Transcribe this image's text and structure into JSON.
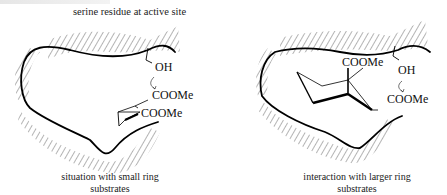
{
  "diagram": {
    "title_fragment": "",
    "left_panel": {
      "top_label": "serine residue at active site",
      "groups": [
        "OH",
        "COOMe",
        "COOMe"
      ],
      "caption_line1": "situation with small ring",
      "caption_line2": "substrates"
    },
    "right_panel": {
      "groups": [
        "COOMe",
        "OH",
        "COOMe"
      ],
      "caption_line1": "interaction with larger ring",
      "caption_line2": "substrates"
    }
  }
}
